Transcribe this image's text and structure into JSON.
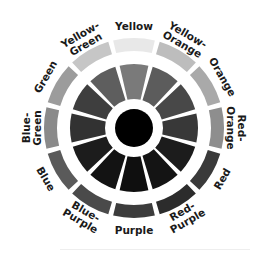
{
  "diagram": {
    "type": "color-wheel",
    "center": [
      134,
      128
    ],
    "radii": {
      "outer_ring_outer": 90,
      "outer_ring_inner": 77,
      "wedge_outer": 64,
      "wedge_inner": 29,
      "core": 19
    },
    "segments": [
      {
        "name": "Yellow",
        "lines": [
          "Yellow"
        ],
        "outer": "#e8e8e8",
        "inner": "#7a7a7a"
      },
      {
        "name": "Yellow-Orange",
        "lines": [
          "Yellow-",
          "Orange"
        ],
        "outer": "#bdbdbd",
        "inner": "#5c5c5c"
      },
      {
        "name": "Orange",
        "lines": [
          "Orange"
        ],
        "outer": "#a9a9a9",
        "inner": "#484848"
      },
      {
        "name": "Red-Orange",
        "lines": [
          "Red-",
          "Orange"
        ],
        "outer": "#8e8e8e",
        "inner": "#383838"
      },
      {
        "name": "Red",
        "lines": [
          "Red"
        ],
        "outer": "#3a3a3a",
        "inner": "#1c1c1c"
      },
      {
        "name": "Red-Purple",
        "lines": [
          "Red-",
          "Purple"
        ],
        "outer": "#2c2c2c",
        "inner": "#141414"
      },
      {
        "name": "Purple",
        "lines": [
          "Purple"
        ],
        "outer": "#3c3c3c",
        "inner": "#0f0f0f"
      },
      {
        "name": "Blue-Purple",
        "lines": [
          "Blue-",
          "Purple"
        ],
        "outer": "#4a4a4a",
        "inner": "#131313"
      },
      {
        "name": "Blue",
        "lines": [
          "Blue"
        ],
        "outer": "#5a5a5a",
        "inner": "#1c1c1c"
      },
      {
        "name": "Blue-Green",
        "lines": [
          "Blue-",
          "Green"
        ],
        "outer": "#8a8a8a",
        "inner": "#323232"
      },
      {
        "name": "Green",
        "lines": [
          "Green"
        ],
        "outer": "#9c9c9c",
        "inner": "#3e3e3e"
      },
      {
        "name": "Yellow-Green",
        "lines": [
          "Yellow-",
          "Green"
        ],
        "outer": "#c6c6c6",
        "inner": "#5e5e5e"
      }
    ],
    "core_color": "#000000",
    "gap_color": "#ffffff"
  }
}
